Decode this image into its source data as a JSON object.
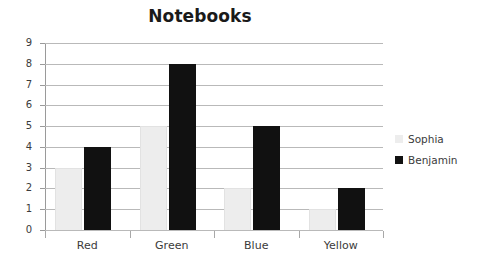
{
  "chart_data": {
    "type": "bar",
    "title": "Notebooks",
    "xlabel": "",
    "ylabel": "",
    "categories": [
      "Red",
      "Green",
      "Blue",
      "Yellow"
    ],
    "series": [
      {
        "name": "Sophia",
        "color": "#ededed",
        "values": [
          3,
          5,
          2,
          1
        ]
      },
      {
        "name": "Benjamin",
        "color": "#111111",
        "values": [
          4,
          8,
          5,
          2
        ]
      }
    ],
    "ylim": [
      0,
      9
    ],
    "ytick_step": 1,
    "yticks": [
      0,
      1,
      2,
      3,
      4,
      5,
      6,
      7,
      8,
      9
    ],
    "ytick_labels": [
      "0",
      "1",
      "2",
      "3",
      "4",
      "5",
      "6",
      "7",
      "8",
      "9"
    ],
    "grid": true,
    "grid_axis": "y",
    "legend_position": "right",
    "background": "#ffffff"
  }
}
